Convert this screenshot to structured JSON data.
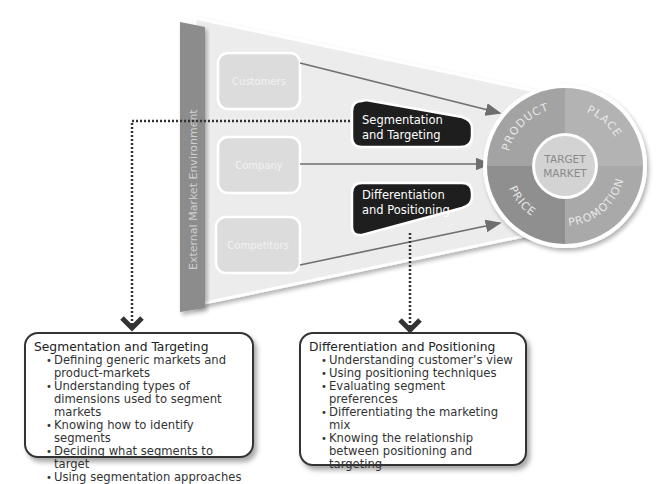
{
  "funnel": {
    "side_label": "External Market Environment",
    "sources": [
      {
        "label": "Customers"
      },
      {
        "label": "Company"
      },
      {
        "label": "Competitors"
      }
    ],
    "stages": [
      {
        "line1": "Segmentation",
        "line2": "and Targeting"
      },
      {
        "line1": "Differentiation",
        "line2": "and Positioning"
      }
    ]
  },
  "target": {
    "center_line1": "TARGET",
    "center_line2": "MARKET",
    "segments": [
      "PRODUCT",
      "PLACE",
      "PROMOTION",
      "PRICE"
    ]
  },
  "cards": {
    "segmentation": {
      "title": "Segmentation and Targeting",
      "items": [
        "Defining generic markets and product-markets",
        "Understanding types of dimensions used to segment markets",
        "Knowing how to identify segments",
        "Deciding what segments to target",
        "Using segmentation approaches"
      ]
    },
    "differentiation": {
      "title": "Differentiation and Positioning",
      "items": [
        "Understanding customer’s view",
        "Using positioning techniques",
        "Evaluating segment preferences",
        "Differentiating the marketing mix",
        "Knowing the relationship between positioning and targeting"
      ]
    }
  },
  "colors": {
    "funnel_bg": "#ececec",
    "side_bar": "#8c8c8c",
    "source_box": "#dcdcdc",
    "stage_box": "#1e1e1e",
    "ring": "#a8a8a8",
    "center": "#d3d3d3",
    "arrow": "#6e6e6e"
  }
}
